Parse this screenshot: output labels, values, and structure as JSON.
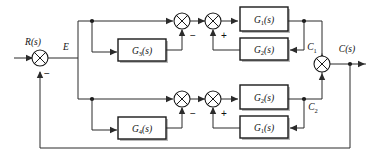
{
  "diagram": {
    "kind": "control-system-block-diagram",
    "signals": {
      "input": "R(s)",
      "error": "E",
      "branch1_output": "C",
      "branch1_output_sub": "1",
      "branch2_output": "C",
      "branch2_output_sub": "2",
      "output": "C(s)"
    },
    "blocks": [
      {
        "id": "upper-inner-feedback",
        "base": "G",
        "sub": "3",
        "arg": "(s)",
        "label": "G3(s)"
      },
      {
        "id": "upper-forward",
        "base": "G",
        "sub": "1",
        "arg": "(s)",
        "label": "G1(s)"
      },
      {
        "id": "upper-outer-feedback",
        "base": "G",
        "sub": "2",
        "arg": "(s)",
        "label": "G2(s)"
      },
      {
        "id": "lower-inner-feedback",
        "base": "G",
        "sub": "4",
        "arg": "(s)",
        "label": "G4(s)"
      },
      {
        "id": "lower-forward",
        "base": "G",
        "sub": "2",
        "arg": "(s)",
        "label": "G2(s)"
      },
      {
        "id": "lower-outer-feedback",
        "base": "G",
        "sub": "1",
        "arg": "(s)",
        "label": "G1(s)"
      }
    ],
    "summers": [
      {
        "id": "input-summer",
        "feedback_sign": "−"
      },
      {
        "id": "upper-first-summer",
        "feedback_sign": "−"
      },
      {
        "id": "upper-second-summer",
        "feedback_sign": "+"
      },
      {
        "id": "lower-first-summer",
        "feedback_sign": "−"
      },
      {
        "id": "lower-second-summer",
        "feedback_sign": "+"
      },
      {
        "id": "output-summer",
        "feedback_sign": ""
      }
    ],
    "colors": {
      "line": "#2b2b2b",
      "block_border": "#1a1a1a",
      "block_fill": "#ffffff",
      "shadow": "#b9b9b9",
      "background": "#ffffff"
    }
  }
}
